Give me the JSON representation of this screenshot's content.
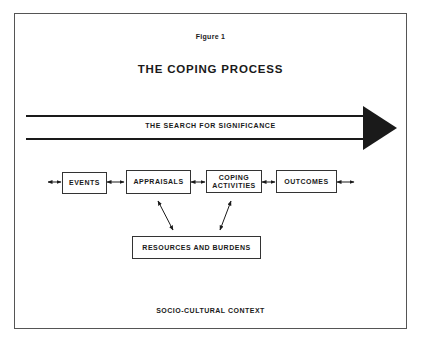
{
  "figure": {
    "label": "Figure 1",
    "title": "THE COPING PROCESS"
  },
  "banner_arrow": {
    "label": "THE SEARCH FOR SIGNIFICANCE",
    "direction": "right"
  },
  "process_boxes": [
    {
      "id": "events",
      "label": "EVENTS"
    },
    {
      "id": "appraisals",
      "label": "APPRAISALS"
    },
    {
      "id": "coping",
      "label_line1": "COPING",
      "label_line2": "ACTIVITIES"
    },
    {
      "id": "outcomes",
      "label": "OUTCOMES"
    }
  ],
  "resources_box": {
    "label": "RESOURCES AND BURDENS"
  },
  "context": {
    "label": "SOCIO-CULTURAL CONTEXT"
  },
  "connectors": [
    {
      "from": "left-edge",
      "to": "events",
      "type": "bidirectional"
    },
    {
      "from": "events",
      "to": "appraisals",
      "type": "bidirectional"
    },
    {
      "from": "appraisals",
      "to": "coping",
      "type": "bidirectional"
    },
    {
      "from": "coping",
      "to": "outcomes",
      "type": "bidirectional"
    },
    {
      "from": "outcomes",
      "to": "right-edge",
      "type": "bidirectional"
    },
    {
      "from": "appraisals",
      "to": "resources",
      "type": "bidirectional"
    },
    {
      "from": "coping",
      "to": "resources",
      "type": "bidirectional"
    }
  ],
  "colors": {
    "ink": "#1a1a1a",
    "paper": "#ffffff"
  }
}
